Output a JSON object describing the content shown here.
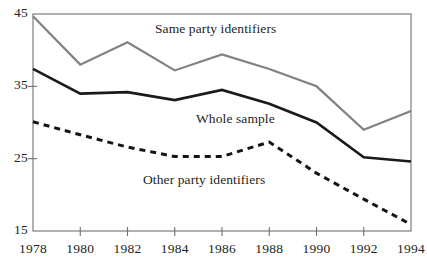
{
  "chart_data": {
    "type": "line",
    "title": "",
    "subtitle": "",
    "xlabel": "",
    "ylabel": "",
    "x": [
      1978,
      1980,
      1982,
      1984,
      1986,
      1988,
      1990,
      1992,
      1994
    ],
    "xticklabels": [
      "1978",
      "1980",
      "1982",
      "1984",
      "1986",
      "1988",
      "1990",
      "1992",
      "1994"
    ],
    "yticklabels": [
      "45",
      "35",
      "25",
      "15"
    ],
    "yticks": [
      45,
      35,
      25,
      15
    ],
    "xlim": [
      1978,
      1994
    ],
    "ylim": [
      15,
      45
    ],
    "grid": false,
    "legend_position": "inline-annotations",
    "series": [
      {
        "name": "Same party identifiers",
        "style": "solid",
        "color": "#808184",
        "width": 2.2,
        "values": [
          44.7,
          38.0,
          41.1,
          37.2,
          39.4,
          37.4,
          35.0,
          29.0,
          31.6
        ],
        "annotation": "Same party identifiers",
        "annotation_x": 155,
        "annotation_y": 21
      },
      {
        "name": "Whole sample",
        "style": "solid",
        "color": "#1a1a1a",
        "width": 2.6,
        "values": [
          37.4,
          34.0,
          34.2,
          33.1,
          34.5,
          32.6,
          30.0,
          25.2,
          24.6
        ],
        "annotation": "Whole sample",
        "annotation_x": 196,
        "annotation_y": 111
      },
      {
        "name": "Other party identifiers",
        "style": "dashed",
        "color": "#141414",
        "width": 3.0,
        "values": [
          30.1,
          28.3,
          26.6,
          25.3,
          25.3,
          27.3,
          23.0,
          19.4,
          15.9
        ],
        "annotation": "Other party identifiers",
        "annotation_x": 143,
        "annotation_y": 172
      }
    ],
    "axis_color": "#6f7072",
    "frame": {
      "left": 33,
      "right": 411,
      "top": 14,
      "bottom": 231
    }
  }
}
